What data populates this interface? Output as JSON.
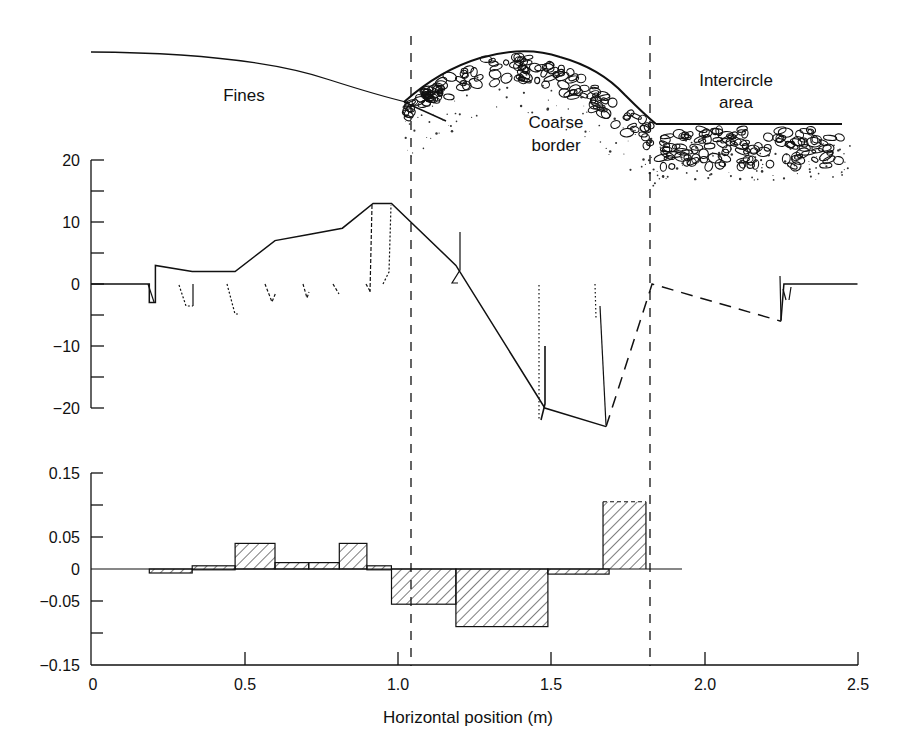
{
  "figure": {
    "schematic": {
      "labels": {
        "fines": "Fines",
        "coarse_line1": "Coarse",
        "coarse_line2": "border",
        "intercircle_line1": "Intercircle",
        "intercircle_line2": "area"
      }
    },
    "xaxis": {
      "label": "Horizontal position (m)",
      "ticks": [
        "0",
        "0.5",
        "1.0",
        "1.5",
        "2.0",
        "2.5"
      ]
    },
    "profile_axis": {
      "ticks": [
        "20",
        "10",
        "0",
        "−10",
        "−20"
      ]
    },
    "histogram_axis": {
      "ticks": [
        "0.15",
        "0.05",
        "0",
        "−0.05",
        "−0.15"
      ]
    },
    "boundaries_m": [
      1.04,
      1.83
    ],
    "colors": {
      "ink": "#111111",
      "background": "#ffffff"
    }
  },
  "chart_data": [
    {
      "type": "line",
      "title": "",
      "xlabel": "Horizontal position (m)",
      "ylabel": "",
      "xlim": [
        0,
        2.5
      ],
      "ylim": [
        -20,
        20
      ],
      "grid": false,
      "series": [
        {
          "name": "profile (solid)",
          "style": "solid",
          "x": [
            0.0,
            0.19,
            0.19,
            0.21,
            0.21,
            0.33,
            0.47,
            0.6,
            0.71,
            0.82,
            0.92,
            0.98,
            1.19,
            1.48,
            1.68
          ],
          "y": [
            0,
            0,
            -3,
            -3,
            3,
            2,
            2,
            7,
            8,
            9,
            13,
            13,
            3,
            -20,
            -23
          ]
        },
        {
          "name": "profile (dashed)",
          "style": "dashed",
          "x": [
            1.68,
            1.83,
            2.25
          ],
          "y": [
            -23,
            0,
            -6
          ]
        },
        {
          "name": "profile (solid, intercircle)",
          "style": "solid",
          "x": [
            2.25,
            2.26,
            2.5
          ],
          "y": [
            -6,
            0,
            0
          ]
        }
      ],
      "annotations": [
        "Fines",
        "Coarse border",
        "Intercircle area"
      ]
    },
    {
      "type": "bar",
      "title": "",
      "xlabel": "Horizontal position (m)",
      "ylabel": "",
      "xlim": [
        0,
        2.5
      ],
      "ylim": [
        -0.15,
        0.15
      ],
      "grid": false,
      "bins": [
        {
          "x0": 0.19,
          "x1": 0.33,
          "value": -0.005
        },
        {
          "x0": 0.33,
          "x1": 0.47,
          "value": 0.005
        },
        {
          "x0": 0.47,
          "x1": 0.6,
          "value": 0.04
        },
        {
          "x0": 0.6,
          "x1": 0.71,
          "value": 0.01
        },
        {
          "x0": 0.71,
          "x1": 0.81,
          "value": 0.01
        },
        {
          "x0": 0.81,
          "x1": 0.9,
          "value": 0.04
        },
        {
          "x0": 0.9,
          "x1": 0.98,
          "value": 0.005
        },
        {
          "x0": 0.98,
          "x1": 1.19,
          "value": -0.055
        },
        {
          "x0": 1.19,
          "x1": 1.49,
          "value": -0.09
        },
        {
          "x0": 1.49,
          "x1": 1.69,
          "value": -0.008
        },
        {
          "x0": 1.67,
          "x1": 1.81,
          "value": 0.105,
          "dashed_top": true
        }
      ]
    }
  ]
}
